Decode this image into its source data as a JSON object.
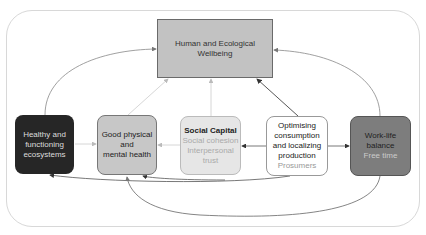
{
  "diagram": {
    "nodes": {
      "wellbeing": {
        "label_line1": "Human and Ecological",
        "label_line2": "Wellbeing"
      },
      "ecosystems": {
        "line1": "Healthy and",
        "line2": "functioning",
        "line3": "ecosystems"
      },
      "health": {
        "line1": "Good physical",
        "line2": "and",
        "line3": "mental health"
      },
      "social": {
        "title": "Social Capital",
        "sub1": "Social cohesion",
        "sub2": "Interpersonal",
        "sub3": "trust"
      },
      "optimising": {
        "line1": "Optimising",
        "line2": "consumption",
        "line3": "and localizing",
        "line4": "production",
        "sub": "Prosumers"
      },
      "worklife": {
        "line1": "Work-life",
        "line2": "balance",
        "sub": "Free time"
      }
    },
    "colors": {
      "wellbeing": "#c2c2c2",
      "ecosystems": "#262626",
      "health": "#c7c7c7",
      "social": "#e6e6e6",
      "optimising": "#ffffff",
      "worklife": "#7d7d7d"
    }
  }
}
